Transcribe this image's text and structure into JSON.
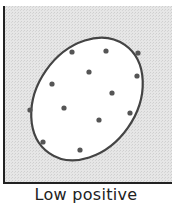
{
  "chart_data": {
    "type": "scatter",
    "title": "",
    "caption": "Low positive",
    "xlabel": "",
    "ylabel": "",
    "grid": false,
    "ellipse": {
      "cx": 87,
      "cy": 99,
      "rx": 66,
      "ry": 50,
      "rotation_deg": -55
    },
    "points": [
      {
        "x": 72,
        "y": 52
      },
      {
        "x": 106,
        "y": 51
      },
      {
        "x": 138,
        "y": 53
      },
      {
        "x": 89,
        "y": 72
      },
      {
        "x": 137,
        "y": 76
      },
      {
        "x": 52,
        "y": 84
      },
      {
        "x": 112,
        "y": 93
      },
      {
        "x": 30,
        "y": 110
      },
      {
        "x": 64,
        "y": 108
      },
      {
        "x": 130,
        "y": 113
      },
      {
        "x": 99,
        "y": 120
      },
      {
        "x": 43,
        "y": 142
      },
      {
        "x": 80,
        "y": 150
      }
    ]
  },
  "colors": {
    "background": "#e4e4e4",
    "ellipse_fill": "#ffffff",
    "ellipse_stroke": "#444444",
    "axis": "#222222",
    "point": "#555555"
  }
}
